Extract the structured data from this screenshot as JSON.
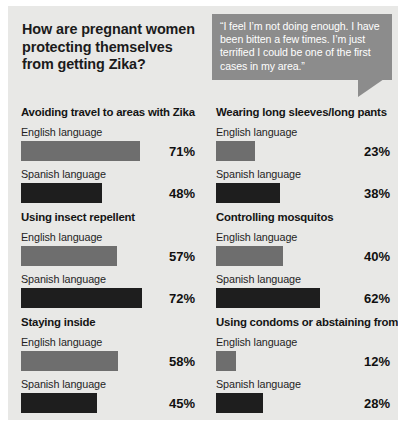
{
  "header": {
    "title": "How are pregnant women protecting themselves from getting Zika?",
    "quote": "“I feel I’m not doing enough. I have been bitten a few times. I’m just terrified I could be one of the first cases in my area.”"
  },
  "labels": {
    "english": "English language",
    "spanish": "Spanish language"
  },
  "colors": {
    "panel_background": "#e8e8e6",
    "english_bar": "#6e6e6e",
    "spanish_bar": "#1e1e1e",
    "quote_box": "#8c8c8c",
    "text": "#1b1b1b"
  },
  "chart_data": {
    "type": "bar",
    "title": "How are pregnant women protecting themselves from getting Zika?",
    "xlabel": "",
    "ylabel": "",
    "xlim": [
      0,
      100
    ],
    "grid": false,
    "legend": [
      "English language",
      "Spanish language"
    ],
    "legend_position": "inline-per-group",
    "unit": "%",
    "categories": [
      "Avoiding travel to areas with Zika",
      "Wearing long sleeves/long pants",
      "Using insect repellent",
      "Controlling mosquitos",
      "Staying inside",
      "Using condoms or abstaining from sex"
    ],
    "series": [
      {
        "name": "English language",
        "values": [
          71,
          23,
          57,
          40,
          58,
          12
        ]
      },
      {
        "name": "Spanish language",
        "values": [
          48,
          38,
          72,
          62,
          45,
          28
        ]
      }
    ],
    "groups": [
      {
        "title": "Avoiding travel to areas with Zika",
        "english": {
          "label": "English language",
          "value": 71,
          "display": "71%"
        },
        "spanish": {
          "label": "Spanish language",
          "value": 48,
          "display": "48%"
        }
      },
      {
        "title": "Wearing long sleeves/long pants",
        "english": {
          "label": "English language",
          "value": 23,
          "display": "23%"
        },
        "spanish": {
          "label": "Spanish language",
          "value": 38,
          "display": "38%"
        }
      },
      {
        "title": "Using insect repellent",
        "english": {
          "label": "English language",
          "value": 57,
          "display": "57%"
        },
        "spanish": {
          "label": "Spanish language",
          "value": 72,
          "display": "72%"
        }
      },
      {
        "title": "Controlling mosquitos",
        "english": {
          "label": "English language",
          "value": 40,
          "display": "40%"
        },
        "spanish": {
          "label": "Spanish language",
          "value": 62,
          "display": "62%"
        }
      },
      {
        "title": "Staying inside",
        "english": {
          "label": "English language",
          "value": 58,
          "display": "58%"
        },
        "spanish": {
          "label": "Spanish language",
          "value": 45,
          "display": "45%"
        }
      },
      {
        "title": "Using condoms or abstaining from sex",
        "english": {
          "label": "English language",
          "value": 12,
          "display": "12%"
        },
        "spanish": {
          "label": "Spanish language",
          "value": 28,
          "display": "28%"
        }
      }
    ]
  }
}
